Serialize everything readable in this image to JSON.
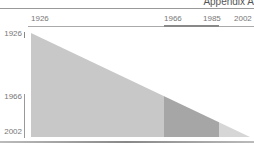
{
  "header": {
    "title": "Appendix A"
  },
  "axis_top": {
    "labels": [
      {
        "text": "1926",
        "x": 31
      },
      {
        "text": "1966",
        "x": 164
      },
      {
        "text": "1985",
        "x": 203
      },
      {
        "text": "2002",
        "x": 234
      }
    ]
  },
  "axis_left": {
    "labels": [
      {
        "text": "1926",
        "y": 29
      },
      {
        "text": "1966",
        "y": 92
      },
      {
        "text": "2002",
        "y": 127
      }
    ]
  },
  "colors": {
    "segment_1": "#c8c8c8",
    "segment_2": "#a6a6a6",
    "segment_3": "#d6d6d6"
  },
  "diagram": {
    "type": "triangle-timeline",
    "segments": [
      {
        "label": "1926-1966",
        "from": 1926,
        "to": 1966
      },
      {
        "label": "1966-1985",
        "from": 1966,
        "to": 1985
      },
      {
        "label": "1985-2002",
        "from": 1985,
        "to": 2002
      }
    ]
  }
}
